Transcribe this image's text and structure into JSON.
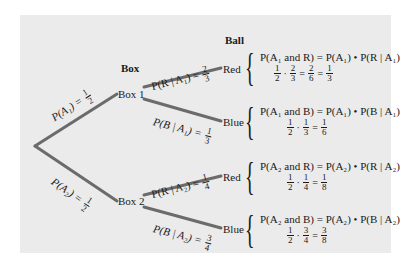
{
  "headers": {
    "box": "Box",
    "ball": "Ball"
  },
  "nodes": {
    "box1": "Box 1",
    "box2": "Box 2",
    "red1": "Red",
    "blue1": "Blue",
    "red2": "Red",
    "blue2": "Blue"
  },
  "branches": {
    "a1": {
      "label": "P(A₁) =",
      "num": "1",
      "den": "2"
    },
    "a2": {
      "label": "P(A₂) =",
      "num": "1",
      "den": "2"
    },
    "r_a1": {
      "label": "P(R | A₁) =",
      "num": "2",
      "den": "3"
    },
    "b_a1": {
      "label": "P(B | A₁) =",
      "num": "1",
      "den": "3"
    },
    "r_a2": {
      "label": "P(R | A₂) =",
      "num": "1",
      "den": "4"
    },
    "b_a2": {
      "label": "P(B | A₂) =",
      "num": "3",
      "den": "4"
    }
  },
  "outcomes": [
    {
      "formula": "P(A₁ and R) = P(A₁) • P(R | A₁)",
      "f1": [
        "1",
        "2"
      ],
      "f2": [
        "2",
        "3"
      ],
      "f3": [
        "2",
        "6"
      ],
      "f4": [
        "1",
        "3"
      ]
    },
    {
      "formula": "P(A₁ and B) = P(A₁) • P(B | A₁)",
      "f1": [
        "1",
        "2"
      ],
      "f2": [
        "1",
        "3"
      ],
      "f3": [
        "1",
        "6"
      ]
    },
    {
      "formula": "P(A₂ and R) = P(A₂) • P(R | A₂)",
      "f1": [
        "1",
        "2"
      ],
      "f2": [
        "1",
        "4"
      ],
      "f3": [
        "1",
        "8"
      ]
    },
    {
      "formula": "P(A₂ and B) = P(A₂) • P(B | A₂)",
      "f1": [
        "1",
        "2"
      ],
      "f2": [
        "3",
        "4"
      ],
      "f3": [
        "3",
        "8"
      ]
    }
  ],
  "symbols": {
    "dot": "·",
    "eq": "="
  },
  "colors": {
    "panel": "#ebebeb",
    "branch": "#6b6b6b",
    "text": "#1a1a1a"
  }
}
